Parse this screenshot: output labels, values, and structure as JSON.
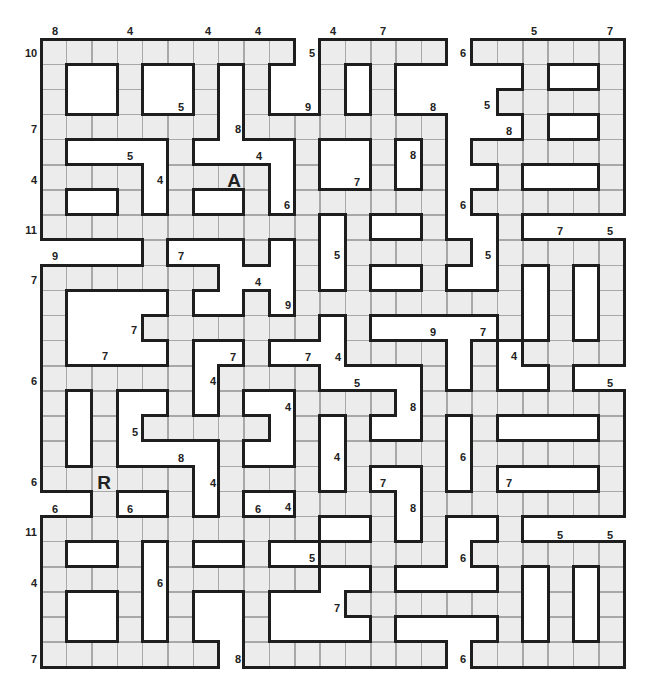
{
  "puzzle": {
    "type": "word-fit crossword grid (word lengths)",
    "cols": 23,
    "rows": 25,
    "origin": [
      41,
      39
    ],
    "cell_size": [
      25.35,
      25.12
    ],
    "cell_color": "#ececec",
    "border_color": "#1e1e1e",
    "grid_map": [
      "##########.#####.######",
      "#..#..#.#..#.#.....#..#",
      "#..#..#.#..#.#....#####",
      "#######.########...#..#",
      "#....#....#..#.#.######",
      "####.####.#..#.#..#...#",
      "#..#.#..#.######.######",
      "###########.#..#..#....",
      "....#...#.#.#####.#####",
      "#######...#.#..#..#.#.#",
      "#....#..#.#########.#.#",
      "#...#######.#.....#.#.#",
      "#....#..#...####.#.####",
      "######.####....#.#..#..",
      "#.#..#.#..####.########",
      "#.#.#####.#.#..#.#....#",
      "#.#....#..#.####.######",
      "######.####.#..#.#....#",
      "..#..#.#..####.########",
      "###########..#.#..#....",
      "#..#.#..#..#####.######",
      "####.######..#....#.#.#",
      "#..#.#..#...#######.#.#",
      "#..#.#..#....#....#.#.#",
      "#######.########.######"
    ],
    "letters": [
      {
        "text": "A",
        "x": 234,
        "y": 180
      },
      {
        "text": "R",
        "x": 104,
        "y": 482
      }
    ],
    "length_labels": [
      {
        "text": "8",
        "x": 55,
        "y": 31
      },
      {
        "text": "4",
        "x": 130,
        "y": 31
      },
      {
        "text": "4",
        "x": 208,
        "y": 31
      },
      {
        "text": "4",
        "x": 258,
        "y": 31
      },
      {
        "text": "4",
        "x": 333,
        "y": 31
      },
      {
        "text": "7",
        "x": 383,
        "y": 31
      },
      {
        "text": "5",
        "x": 534,
        "y": 31
      },
      {
        "text": "7",
        "x": 610,
        "y": 31
      },
      {
        "text": "10",
        "x": 31,
        "y": 53
      },
      {
        "text": "7",
        "x": 34,
        "y": 129
      },
      {
        "text": "4",
        "x": 34,
        "y": 180
      },
      {
        "text": "11",
        "x": 31,
        "y": 230
      },
      {
        "text": "7",
        "x": 34,
        "y": 280
      },
      {
        "text": "6",
        "x": 34,
        "y": 381
      },
      {
        "text": "6",
        "x": 34,
        "y": 482
      },
      {
        "text": "11",
        "x": 31,
        "y": 532
      },
      {
        "text": "4",
        "x": 34,
        "y": 583
      },
      {
        "text": "7",
        "x": 34,
        "y": 659
      },
      {
        "text": "9",
        "x": 55,
        "y": 256
      },
      {
        "text": "5",
        "x": 312,
        "y": 53
      },
      {
        "text": "6",
        "x": 463,
        "y": 53
      },
      {
        "text": "5",
        "x": 181,
        "y": 107
      },
      {
        "text": "9",
        "x": 308,
        "y": 107
      },
      {
        "text": "8",
        "x": 433,
        "y": 107
      },
      {
        "text": "5",
        "x": 487,
        "y": 105
      },
      {
        "text": "8",
        "x": 238,
        "y": 129
      },
      {
        "text": "8",
        "x": 509,
        "y": 131
      },
      {
        "text": "5",
        "x": 130,
        "y": 156
      },
      {
        "text": "4",
        "x": 259,
        "y": 156
      },
      {
        "text": "8",
        "x": 413,
        "y": 155
      },
      {
        "text": "4",
        "x": 160,
        "y": 180
      },
      {
        "text": "7",
        "x": 357,
        "y": 182
      },
      {
        "text": "6",
        "x": 287,
        "y": 205
      },
      {
        "text": "6",
        "x": 463,
        "y": 205
      },
      {
        "text": "7",
        "x": 560,
        "y": 231
      },
      {
        "text": "5",
        "x": 610,
        "y": 231
      },
      {
        "text": "5",
        "x": 337,
        "y": 255
      },
      {
        "text": "7",
        "x": 181,
        "y": 256
      },
      {
        "text": "5",
        "x": 488,
        "y": 255
      },
      {
        "text": "4",
        "x": 258,
        "y": 282
      },
      {
        "text": "9",
        "x": 288,
        "y": 305
      },
      {
        "text": "7",
        "x": 134,
        "y": 330
      },
      {
        "text": "9",
        "x": 433,
        "y": 332
      },
      {
        "text": "7",
        "x": 483,
        "y": 332
      },
      {
        "text": "7",
        "x": 105,
        "y": 356
      },
      {
        "text": "7",
        "x": 233,
        "y": 357
      },
      {
        "text": "7",
        "x": 308,
        "y": 357
      },
      {
        "text": "4",
        "x": 338,
        "y": 357
      },
      {
        "text": "4",
        "x": 514,
        "y": 356
      },
      {
        "text": "4",
        "x": 213,
        "y": 381
      },
      {
        "text": "5",
        "x": 357,
        "y": 383
      },
      {
        "text": "5",
        "x": 610,
        "y": 383
      },
      {
        "text": "4",
        "x": 288,
        "y": 407
      },
      {
        "text": "8",
        "x": 413,
        "y": 407
      },
      {
        "text": "5",
        "x": 135,
        "y": 432
      },
      {
        "text": "4",
        "x": 337,
        "y": 457
      },
      {
        "text": "6",
        "x": 463,
        "y": 457
      },
      {
        "text": "8",
        "x": 181,
        "y": 458
      },
      {
        "text": "4",
        "x": 213,
        "y": 483
      },
      {
        "text": "7",
        "x": 383,
        "y": 483
      },
      {
        "text": "7",
        "x": 509,
        "y": 483
      },
      {
        "text": "8",
        "x": 413,
        "y": 508
      },
      {
        "text": "6",
        "x": 55,
        "y": 509
      },
      {
        "text": "6",
        "x": 130,
        "y": 509
      },
      {
        "text": "6",
        "x": 258,
        "y": 509
      },
      {
        "text": "4",
        "x": 288,
        "y": 507
      },
      {
        "text": "5",
        "x": 312,
        "y": 558
      },
      {
        "text": "5",
        "x": 560,
        "y": 535
      },
      {
        "text": "5",
        "x": 610,
        "y": 535
      },
      {
        "text": "6",
        "x": 160,
        "y": 583
      },
      {
        "text": "6",
        "x": 463,
        "y": 558
      },
      {
        "text": "7",
        "x": 337,
        "y": 608
      },
      {
        "text": "8",
        "x": 238,
        "y": 659
      },
      {
        "text": "6",
        "x": 463,
        "y": 659
      }
    ]
  }
}
